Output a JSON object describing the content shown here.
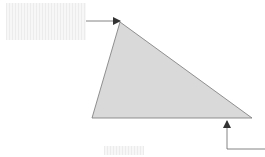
{
  "diagram": {
    "type": "annotated-triangle",
    "shape": {
      "kind": "triangle",
      "fill": "#d9d9d9",
      "stroke": "#666666",
      "vertices": [
        [
          120,
          22
        ],
        [
          92,
          118
        ],
        [
          252,
          118
        ]
      ]
    },
    "labels": [
      {
        "id": "top-left-label",
        "text": "",
        "redacted": true
      },
      {
        "id": "bottom-center-label",
        "text": "",
        "redacted": true
      }
    ],
    "arrows": [
      {
        "id": "arrow-to-top-vertex",
        "from": "top-left-label",
        "to": "top vertex"
      },
      {
        "id": "arrow-to-base",
        "from": "right edge",
        "to": "base near right vertex"
      }
    ],
    "colors": {
      "arrow": "#666666",
      "shape_fill": "#d9d9d9",
      "label_placeholder": "#ececec"
    }
  }
}
